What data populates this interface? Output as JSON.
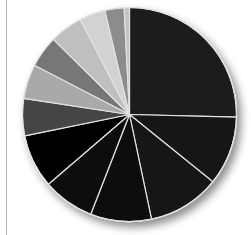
{
  "chart_data": {
    "type": "pie",
    "title": "",
    "legend": null,
    "start_angle_deg": 0,
    "direction": "clockwise",
    "labels": [
      "",
      "",
      "",
      "",
      "",
      "",
      "",
      "",
      "",
      "",
      "",
      "",
      ""
    ],
    "values": [
      25.4,
      10.4,
      10.9,
      9.2,
      7.8,
      8.1,
      5.6,
      5.2,
      4.8,
      5.0,
      3.9,
      2.9,
      0.8
    ],
    "colors": [
      "#1c1c1c",
      "#161616",
      "#141414",
      "#111111",
      "#0d0d0d",
      "#050505",
      "#454545",
      "#a9a9a9",
      "#777777",
      "#bfbfbf",
      "#d2d2d2",
      "#8c8c8c",
      "#c4c4c4"
    ],
    "slice_border_color": "#e2e2e2",
    "center": [
      129.5,
      114.5
    ],
    "radius": 107
  },
  "page": {
    "left_rule_color": "#b4b4b4"
  }
}
